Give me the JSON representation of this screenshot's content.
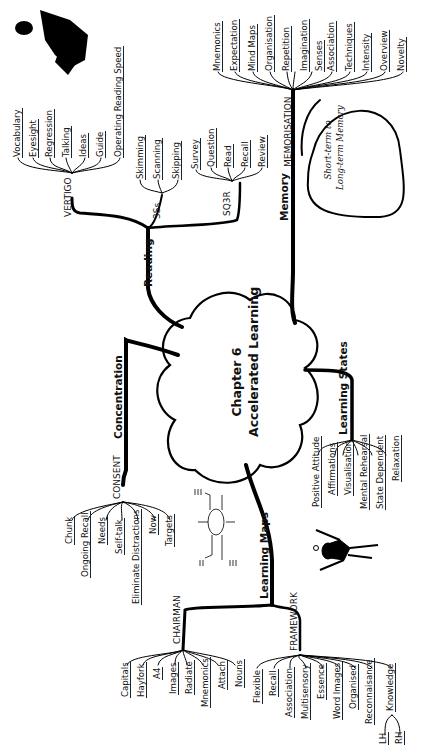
{
  "center": {
    "line1": "Chapter 6",
    "line2": "Accelerated Learning"
  },
  "branches": {
    "reading": {
      "label": "Reading",
      "vertigo": {
        "label": "VERTIGO",
        "items": [
          "Vocabulary",
          "Eyesight",
          "Regression",
          "Talking",
          "Ideas",
          "Guide",
          "Operating Reading Speed"
        ]
      },
      "threes": {
        "label": "3Ss",
        "items": [
          "Skimming",
          "Scanning",
          "Skipping"
        ]
      },
      "sq3r": {
        "label": "SQ3R",
        "items": [
          "Survey",
          "Question",
          "Read",
          "Recall",
          "Review"
        ]
      }
    },
    "memory": {
      "label": "Memory",
      "memorisation": {
        "label": "MEMORISATION",
        "items": [
          "Mnemonics",
          "Expectation",
          "Mind Maps",
          "Organisation",
          "Repetition",
          "Imagination",
          "Senses",
          "Association",
          "Techniques",
          "Intensity",
          "Overview",
          "Novelty"
        ]
      },
      "note": {
        "line1": "Short-term to",
        "line2": "Long-term Memory"
      }
    },
    "concentration": {
      "label": "Concentration",
      "consent": {
        "label": "CONSENT",
        "items": [
          "Chunk",
          "Ongoing Recall",
          "Needs",
          "Self-talk",
          "Eliminate Distractions",
          "Now",
          "Targets"
        ]
      }
    },
    "learning_states": {
      "label": "Learning States",
      "items": [
        "Positive Attitude",
        "Affirmations",
        "Visualisation",
        "Mental Rehearsal",
        "State Dependent",
        "Relaxation"
      ]
    },
    "learning_maps": {
      "label": "Learning Maps",
      "chairman": {
        "label": "CHAIRMAN",
        "items": [
          "Capitals",
          "Hayfork",
          "A4",
          "Images",
          "Radiate",
          "Mnemonics",
          "Attach",
          "Nouns"
        ]
      },
      "framework": {
        "label": "FRAMEWORK",
        "items": [
          "Flexible",
          "Recall",
          "Association",
          "Multisensory",
          "Essence",
          "Word Images",
          "Organised",
          "Reconnaisance",
          "Knowledge"
        ],
        "knowledge_sub": [
          "LH",
          "RH"
        ]
      }
    }
  }
}
